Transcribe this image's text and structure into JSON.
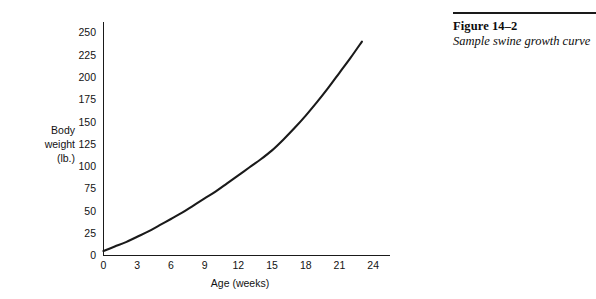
{
  "caption": {
    "number": "Figure 14–2",
    "text": "Sample swine growth curve"
  },
  "chart_data": {
    "type": "line",
    "title": "",
    "xlabel": "Age (weeks)",
    "ylabel": "Body weight (lb.)",
    "ylabel_lines": [
      "Body",
      "weight",
      "(lb.)"
    ],
    "xlim": [
      0,
      25.5
    ],
    "ylim": [
      0,
      262
    ],
    "xticks": [
      0,
      3,
      6,
      9,
      12,
      15,
      18,
      21,
      24
    ],
    "xtick_labels": [
      "0",
      "3",
      "6",
      "9",
      "12",
      "15",
      "18",
      "21",
      "24"
    ],
    "yticks": [
      0,
      25,
      50,
      75,
      100,
      125,
      150,
      175,
      200,
      225,
      250
    ],
    "ytick_labels": [
      "0",
      "25",
      "50",
      "75",
      "100",
      "125",
      "150",
      "175",
      "200",
      "225",
      "250"
    ],
    "grid": false,
    "legend": false,
    "line_color": "#1a1a1a",
    "axis_color": "#1a1a1a",
    "series": [
      {
        "name": "Swine growth curve",
        "x": [
          0,
          1,
          2,
          3,
          4,
          5,
          6,
          7,
          8,
          9,
          10,
          11,
          12,
          13,
          14,
          15,
          16,
          17,
          18,
          19,
          20,
          21,
          22,
          23
        ],
        "values": [
          5,
          10,
          15,
          21,
          27,
          34,
          41,
          48,
          56,
          64,
          72,
          81,
          90,
          99,
          108,
          118,
          130,
          143,
          157,
          172,
          188,
          205,
          222,
          240
        ]
      }
    ]
  }
}
